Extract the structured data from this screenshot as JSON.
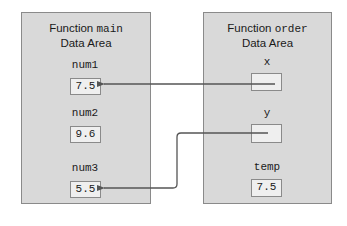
{
  "diagram": {
    "left_panel": {
      "title_prefix": "Function ",
      "title_func": "main",
      "title_suffix": "Data Area",
      "variables": [
        {
          "name": "num1",
          "value": "7.5"
        },
        {
          "name": "num2",
          "value": "9.6"
        },
        {
          "name": "num3",
          "value": "5.5"
        }
      ]
    },
    "right_panel": {
      "title_prefix": "Function ",
      "title_func": "order",
      "title_suffix": "Data Area",
      "variables": [
        {
          "name": "x",
          "value": ""
        },
        {
          "name": "y",
          "value": ""
        },
        {
          "name": "temp",
          "value": "7.5"
        }
      ]
    },
    "arrows": [
      {
        "from": "x",
        "to": "num1"
      },
      {
        "from": "y",
        "to": "num3"
      }
    ],
    "colors": {
      "panel_fill": "#d9d9d9",
      "panel_border": "#8a8a8a",
      "box_fill": "#efefef",
      "arrow": "#555555"
    }
  }
}
